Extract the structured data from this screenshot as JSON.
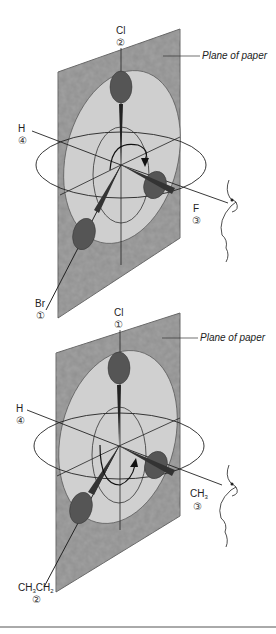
{
  "figure": {
    "panels": [
      {
        "id": "top",
        "plane_label": "Plane of paper",
        "substituents": [
          {
            "atom": "Cl",
            "priority": "②",
            "position": "top"
          },
          {
            "atom": "H",
            "priority": "④",
            "position": "left"
          },
          {
            "atom": "F",
            "priority": "③",
            "position": "right-front"
          },
          {
            "atom": "Br",
            "priority": "①",
            "position": "bottom-left"
          }
        ]
      },
      {
        "id": "bottom",
        "plane_label": "Plane of paper",
        "substituents": [
          {
            "atom": "Cl",
            "priority": "①",
            "position": "top"
          },
          {
            "atom": "H",
            "priority": "④",
            "position": "left"
          },
          {
            "atom": "CH3",
            "atom_main": "CH",
            "atom_sub": "3",
            "priority": "③",
            "position": "right-front"
          },
          {
            "atom": "CH3CH2",
            "atom_parts": [
              "CH",
              "3",
              "CH",
              "2"
            ],
            "priority": "②",
            "position": "bottom-left"
          }
        ]
      }
    ],
    "colors": {
      "plane": "#8a8a8a",
      "ellipse": "#c8c8c8",
      "lobe": "#555555",
      "line": "#222222"
    }
  }
}
